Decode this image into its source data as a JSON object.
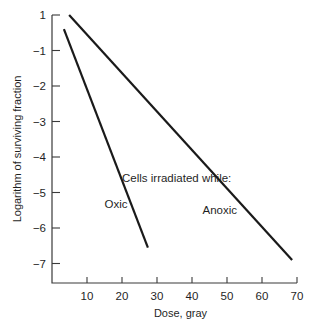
{
  "chart_data": {
    "type": "line",
    "title": "",
    "xlabel": "Dose, gray",
    "ylabel": "Logarithm of surviving fraction",
    "xlim": [
      0,
      70
    ],
    "ylim": [
      -7.3,
      0
    ],
    "grid": false,
    "x_ticks": [
      {
        "value": 10,
        "label": "10"
      },
      {
        "value": 20,
        "label": "20"
      },
      {
        "value": 30,
        "label": "30"
      },
      {
        "value": 40,
        "label": "40"
      },
      {
        "value": 50,
        "label": "50"
      },
      {
        "value": 60,
        "label": "60"
      },
      {
        "value": 70,
        "label": "70"
      }
    ],
    "y_ticks": [
      {
        "value": 0,
        "label": "1"
      },
      {
        "value": -1,
        "label": "−1"
      },
      {
        "value": -2,
        "label": "−2"
      },
      {
        "value": -3,
        "label": "−3"
      },
      {
        "value": -4,
        "label": "−4"
      },
      {
        "value": -5,
        "label": "−5"
      },
      {
        "value": -6,
        "label": "−6"
      },
      {
        "value": -7,
        "label": "−7"
      }
    ],
    "series": [
      {
        "name": "Oxic",
        "x": [
          3.4,
          27.4
        ],
        "y": [
          -0.4,
          -6.55
        ]
      },
      {
        "name": "Anoxic",
        "x": [
          4.9,
          68.6
        ],
        "y": [
          0.0,
          -6.9
        ]
      }
    ],
    "annotations": [
      {
        "id": "header",
        "text": "Cells irradiated while:",
        "x": 20,
        "y": -4.7
      },
      {
        "id": "oxic",
        "text": "Oxic",
        "x": 15,
        "y": -5.45
      },
      {
        "id": "anoxic",
        "text": "Anoxic",
        "x": 43,
        "y": -5.6
      }
    ]
  }
}
